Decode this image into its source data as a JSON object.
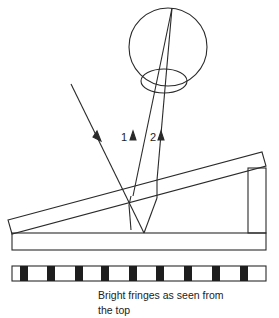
{
  "diagram": {
    "ray_labels": [
      "1",
      "2"
    ],
    "caption_line1": "Bright fringes as seen from",
    "caption_line2": "the top",
    "stroke_color": "#2a2a2a",
    "fringe_color": "#1e1e1e",
    "fringes": [
      {
        "x": 20
      },
      {
        "x": 47
      },
      {
        "x": 75
      },
      {
        "x": 101
      },
      {
        "x": 129
      },
      {
        "x": 156
      },
      {
        "x": 184
      },
      {
        "x": 212
      },
      {
        "x": 240
      }
    ]
  }
}
